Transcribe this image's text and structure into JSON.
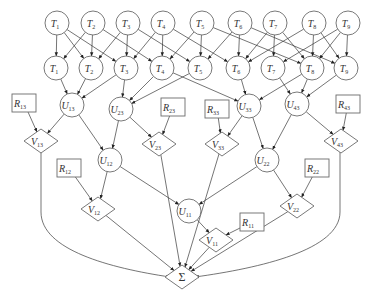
{
  "diagram": {
    "type": "directed-graph",
    "colors": {
      "stroke": "#6a6a6a",
      "edge": "#3a3a3a",
      "background": "#ffffff"
    },
    "nodes": [
      {
        "id": "T1_top",
        "shape": "circle",
        "label": "T",
        "sub": "1",
        "x": 57,
        "y": 23
      },
      {
        "id": "T2_top",
        "shape": "circle",
        "label": "T",
        "sub": "2",
        "x": 93,
        "y": 23
      },
      {
        "id": "T3_top",
        "shape": "circle",
        "label": "T",
        "sub": "3",
        "x": 128,
        "y": 23
      },
      {
        "id": "T4_top",
        "shape": "circle",
        "label": "T",
        "sub": "4",
        "x": 163,
        "y": 23
      },
      {
        "id": "T5_top",
        "shape": "circle",
        "label": "T",
        "sub": "5",
        "x": 202,
        "y": 23
      },
      {
        "id": "T6_top",
        "shape": "circle",
        "label": "T",
        "sub": "6",
        "x": 240,
        "y": 23
      },
      {
        "id": "T7_top",
        "shape": "circle",
        "label": "T",
        "sub": "7",
        "x": 275,
        "y": 23
      },
      {
        "id": "T8_top",
        "shape": "circle",
        "label": "T",
        "sub": "8",
        "x": 314,
        "y": 23
      },
      {
        "id": "T9_top",
        "shape": "circle",
        "label": "T",
        "sub": "9",
        "x": 348,
        "y": 23
      },
      {
        "id": "T1",
        "shape": "circle",
        "label": "T",
        "sub": "1",
        "x": 56,
        "y": 68
      },
      {
        "id": "T2",
        "shape": "circle",
        "label": "T",
        "sub": "2",
        "x": 91,
        "y": 68
      },
      {
        "id": "T3",
        "shape": "circle",
        "label": "T",
        "sub": "3",
        "x": 126,
        "y": 68
      },
      {
        "id": "T4",
        "shape": "circle",
        "label": "T",
        "sub": "4",
        "x": 162,
        "y": 68
      },
      {
        "id": "T5",
        "shape": "circle",
        "label": "T",
        "sub": "5",
        "x": 200,
        "y": 68
      },
      {
        "id": "T6",
        "shape": "circle",
        "label": "T",
        "sub": "6",
        "x": 238,
        "y": 68
      },
      {
        "id": "T7",
        "shape": "circle",
        "label": "T",
        "sub": "7",
        "x": 273,
        "y": 68
      },
      {
        "id": "T8",
        "shape": "circle",
        "label": "T",
        "sub": "8",
        "x": 312,
        "y": 68
      },
      {
        "id": "T9",
        "shape": "circle",
        "label": "T",
        "sub": "9",
        "x": 346,
        "y": 68
      },
      {
        "id": "U13",
        "shape": "circle",
        "label": "U",
        "sub": "13",
        "x": 72,
        "y": 105
      },
      {
        "id": "U23",
        "shape": "circle",
        "label": "U",
        "sub": "23",
        "x": 121,
        "y": 109
      },
      {
        "id": "U33",
        "shape": "circle",
        "label": "U",
        "sub": "33",
        "x": 249,
        "y": 106
      },
      {
        "id": "U43",
        "shape": "circle",
        "label": "U",
        "sub": "43",
        "x": 297,
        "y": 104
      },
      {
        "id": "R13",
        "shape": "rect",
        "label": "R",
        "sub": "13",
        "x": 24,
        "y": 103
      },
      {
        "id": "R23",
        "shape": "rect",
        "label": "R",
        "sub": "23",
        "x": 173,
        "y": 107
      },
      {
        "id": "R33",
        "shape": "rect",
        "label": "R",
        "sub": "33",
        "x": 217,
        "y": 109
      },
      {
        "id": "R43",
        "shape": "rect",
        "label": "R",
        "sub": "43",
        "x": 348,
        "y": 104
      },
      {
        "id": "V13",
        "shape": "diamond",
        "label": "V",
        "sub": "13",
        "x": 41,
        "y": 141
      },
      {
        "id": "V23",
        "shape": "diamond",
        "label": "V",
        "sub": "23",
        "x": 159,
        "y": 144
      },
      {
        "id": "V33",
        "shape": "diamond",
        "label": "V",
        "sub": "33",
        "x": 222,
        "y": 144
      },
      {
        "id": "V43",
        "shape": "diamond",
        "label": "V",
        "sub": "43",
        "x": 341,
        "y": 141
      },
      {
        "id": "U12",
        "shape": "circle",
        "label": "U",
        "sub": "12",
        "x": 110,
        "y": 160
      },
      {
        "id": "U22",
        "shape": "circle",
        "label": "U",
        "sub": "22",
        "x": 267,
        "y": 160
      },
      {
        "id": "R12",
        "shape": "rect",
        "label": "R",
        "sub": "12",
        "x": 69,
        "y": 168
      },
      {
        "id": "R22",
        "shape": "rect",
        "label": "R",
        "sub": "22",
        "x": 317,
        "y": 168
      },
      {
        "id": "V12",
        "shape": "diamond",
        "label": "V",
        "sub": "12",
        "x": 98,
        "y": 209
      },
      {
        "id": "V22",
        "shape": "diamond",
        "label": "V",
        "sub": "22",
        "x": 297,
        "y": 206
      },
      {
        "id": "U11",
        "shape": "circle",
        "label": "U",
        "sub": "11",
        "x": 189,
        "y": 211
      },
      {
        "id": "R11",
        "shape": "rect",
        "label": "R",
        "sub": "11",
        "x": 252,
        "y": 222
      },
      {
        "id": "V11",
        "shape": "diamond",
        "label": "V",
        "sub": "11",
        "x": 216,
        "y": 240
      },
      {
        "id": "SUM",
        "shape": "diamond",
        "label": "Σ",
        "sub": "",
        "x": 182,
        "y": 277
      }
    ],
    "edges": [
      [
        "T1_top",
        "T1"
      ],
      [
        "T1_top",
        "T2"
      ],
      [
        "T1_top",
        "T3"
      ],
      [
        "T2_top",
        "T1"
      ],
      [
        "T2_top",
        "T2"
      ],
      [
        "T2_top",
        "T4"
      ],
      [
        "T3_top",
        "T2"
      ],
      [
        "T3_top",
        "T3"
      ],
      [
        "T3_top",
        "T5"
      ],
      [
        "T4_top",
        "T3"
      ],
      [
        "T4_top",
        "T4"
      ],
      [
        "T4_top",
        "T6"
      ],
      [
        "T5_top",
        "T4"
      ],
      [
        "T5_top",
        "T5"
      ],
      [
        "T5_top",
        "T8"
      ],
      [
        "T6_top",
        "T5"
      ],
      [
        "T6_top",
        "T6"
      ],
      [
        "T6_top",
        "T9"
      ],
      [
        "T7_top",
        "T6"
      ],
      [
        "T7_top",
        "T7"
      ],
      [
        "T7_top",
        "T8"
      ],
      [
        "T8_top",
        "T6"
      ],
      [
        "T8_top",
        "T8"
      ],
      [
        "T8_top",
        "T9"
      ],
      [
        "T9_top",
        "T7"
      ],
      [
        "T9_top",
        "T8"
      ],
      [
        "T9_top",
        "T9"
      ],
      [
        "T1",
        "U13"
      ],
      [
        "T2",
        "U13"
      ],
      [
        "T3",
        "U13"
      ],
      [
        "T3",
        "U23"
      ],
      [
        "T4",
        "U23"
      ],
      [
        "T5",
        "U23"
      ],
      [
        "T4",
        "U33"
      ],
      [
        "T6",
        "U33"
      ],
      [
        "T8",
        "U33"
      ],
      [
        "T7",
        "U43"
      ],
      [
        "T8",
        "U43"
      ],
      [
        "T9",
        "U43"
      ],
      [
        "R13",
        "V13"
      ],
      [
        "U13",
        "V13"
      ],
      [
        "U23",
        "V23"
      ],
      [
        "R23",
        "V23"
      ],
      [
        "R33",
        "V33"
      ],
      [
        "U33",
        "V33"
      ],
      [
        "U43",
        "V43"
      ],
      [
        "R43",
        "V43"
      ],
      [
        "U13",
        "U12"
      ],
      [
        "U23",
        "U12"
      ],
      [
        "U33",
        "U22"
      ],
      [
        "U43",
        "U22"
      ],
      [
        "R12",
        "V12"
      ],
      [
        "U12",
        "V12"
      ],
      [
        "U22",
        "V22"
      ],
      [
        "R22",
        "V22"
      ],
      [
        "U12",
        "U11"
      ],
      [
        "U22",
        "U11"
      ],
      [
        "U11",
        "V11"
      ],
      [
        "R11",
        "V11"
      ],
      [
        "V12",
        "SUM"
      ],
      [
        "V23",
        "SUM"
      ],
      [
        "V33",
        "SUM"
      ],
      [
        "V11",
        "SUM"
      ],
      [
        "V22",
        "SUM"
      ]
    ],
    "curved_edges": [
      {
        "from": "V13",
        "to": "SUM",
        "path": "M41,152 L41,212 C41,250 110,268 170,277"
      },
      {
        "from": "V43",
        "to": "SUM",
        "path": "M340,152 L340,212 C340,250 260,268 195,277"
      }
    ]
  }
}
